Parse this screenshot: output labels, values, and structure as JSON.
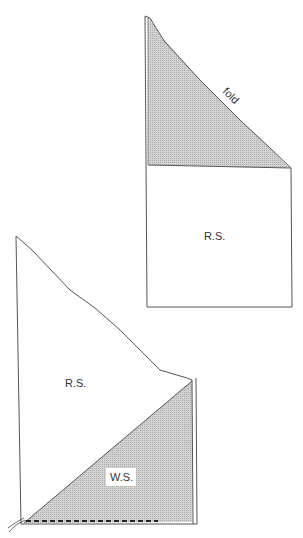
{
  "top_figure": {
    "fold_label": "fold",
    "panel_label": "R.S."
  },
  "bottom_figure": {
    "panel_label": "R.S.",
    "shaded_label": "W.S."
  },
  "colors": {
    "line": "#555555",
    "shade": "#c8c8c8",
    "stitch": "#222222"
  }
}
